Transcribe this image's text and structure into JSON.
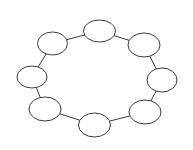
{
  "diagram": {
    "type": "ring",
    "width": 193,
    "height": 150,
    "background": "#ffffff",
    "stroke_color": "#3a3a3a",
    "stroke_width": 1,
    "node_fill": "#ffffff",
    "nodes": [
      {
        "id": "n1",
        "label": "",
        "cx": 99.5,
        "cy": 31,
        "rx": 16,
        "ry": 11
      },
      {
        "id": "n2",
        "label": "",
        "cx": 144,
        "cy": 45,
        "rx": 16,
        "ry": 12
      },
      {
        "id": "n3",
        "label": "",
        "cx": 162,
        "cy": 80,
        "rx": 15,
        "ry": 12
      },
      {
        "id": "n4",
        "label": "",
        "cx": 145,
        "cy": 112,
        "rx": 16,
        "ry": 12
      },
      {
        "id": "n5",
        "label": "",
        "cx": 94.5,
        "cy": 125,
        "rx": 16,
        "ry": 12
      },
      {
        "id": "n6",
        "label": "",
        "cx": 45,
        "cy": 109,
        "rx": 16,
        "ry": 12
      },
      {
        "id": "n7",
        "label": "",
        "cx": 32,
        "cy": 77,
        "rx": 15,
        "ry": 11
      },
      {
        "id": "n8",
        "label": "",
        "cx": 52.5,
        "cy": 43.5,
        "rx": 15,
        "ry": 11.5
      }
    ],
    "edges": [
      {
        "from": "n1",
        "to": "n2"
      },
      {
        "from": "n2",
        "to": "n3"
      },
      {
        "from": "n3",
        "to": "n4"
      },
      {
        "from": "n4",
        "to": "n5"
      },
      {
        "from": "n5",
        "to": "n6"
      },
      {
        "from": "n6",
        "to": "n7"
      },
      {
        "from": "n7",
        "to": "n8"
      },
      {
        "from": "n8",
        "to": "n1"
      }
    ]
  }
}
